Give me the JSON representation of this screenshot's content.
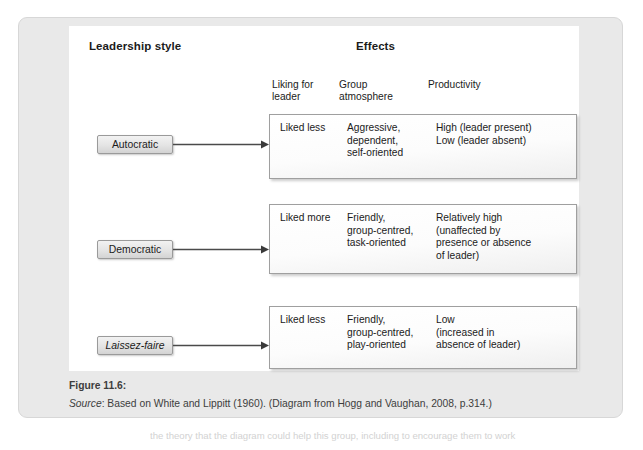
{
  "figure": {
    "headings": {
      "leadership_style": "Leadership style",
      "effects": "Effects"
    },
    "sub_headings": [
      "Liking for\nleader",
      "Group\natmosphere",
      "Productivity"
    ],
    "rows": [
      {
        "style_label": "Autocratic",
        "style_italic": false,
        "liking_for_leader": "Liked less",
        "group_atmosphere": "Aggressive,\ndependent,\nself-oriented",
        "productivity": "High (leader present)\nLow (leader absent)"
      },
      {
        "style_label": "Democratic",
        "style_italic": false,
        "liking_for_leader": "Liked more",
        "group_atmosphere": "Friendly,\ngroup-centred,\ntask-oriented",
        "productivity": "Relatively high\n(unaffected by\npresence or absence\nof leader)"
      },
      {
        "style_label": "Laissez-faire",
        "style_italic": true,
        "liking_for_leader": "Liked less",
        "group_atmosphere": "Friendly,\ngroup-centred,\nplay-oriented",
        "productivity": "Low\n(increased in\nabsence of leader)"
      }
    ],
    "caption": {
      "figure_number": "Figure 11.6:",
      "source_label": "Source",
      "source_text": ": Based on White and Lippitt (1960). (Diagram from Hogg and Vaughan, 2008, p.314.)"
    }
  },
  "page_bleed_text": "the theory that the diagram could help this group, including to encourage them to work",
  "colors": {
    "card_background": "#e9e9e9",
    "panel_background": "#ffffff",
    "box_border": "#9f9f9f",
    "text": "#1b1b1b",
    "caption_text": "#3d3d3d",
    "arrow": "#4a4a4a"
  }
}
